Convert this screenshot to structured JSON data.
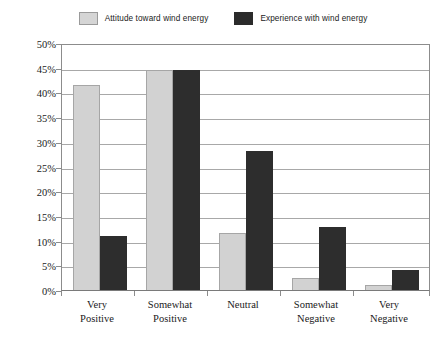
{
  "legend": {
    "position": "top-center",
    "entries": [
      {
        "label": "Attitude toward wind energy",
        "swatch": "light-gray-swatch-icon",
        "color": "#d5d5d5"
      },
      {
        "label": "Experience with wind energy",
        "swatch": "dark-swatch-icon",
        "color": "#2b2b2b"
      }
    ]
  },
  "axes": {
    "y_ticks": [
      "50%",
      "45%",
      "40%",
      "35%",
      "30%",
      "25%",
      "20%",
      "15%",
      "10%",
      "5%",
      "0%"
    ],
    "x_categories": [
      {
        "line1": "Very",
        "line2": "Positive"
      },
      {
        "line1": "Somewhat",
        "line2": "Positive"
      },
      {
        "line1": "Neutral",
        "line2": ""
      },
      {
        "line1": "Somewhat",
        "line2": "Negative"
      },
      {
        "line1": "Very",
        "line2": "Negative"
      }
    ]
  },
  "chart_data": {
    "type": "bar",
    "title": "",
    "subtitle": "",
    "xlabel": "",
    "ylabel": "",
    "ylim": [
      0,
      50
    ],
    "ytick_step": 5,
    "ytick_format": "percent",
    "grid": true,
    "legend_position": "top-center",
    "categories": [
      "Very Positive",
      "Somewhat Positive",
      "Neutral",
      "Somewhat Negative",
      "Very Negative"
    ],
    "series": [
      {
        "name": "Attitude toward wind energy",
        "color": "#d2d2d2",
        "values": [
          41.5,
          44.5,
          11.5,
          2.4,
          1.0
        ]
      },
      {
        "name": "Experience with wind energy",
        "color": "#2d2d2d",
        "values": [
          10.9,
          44.5,
          28.1,
          12.7,
          4.0
        ]
      }
    ]
  }
}
